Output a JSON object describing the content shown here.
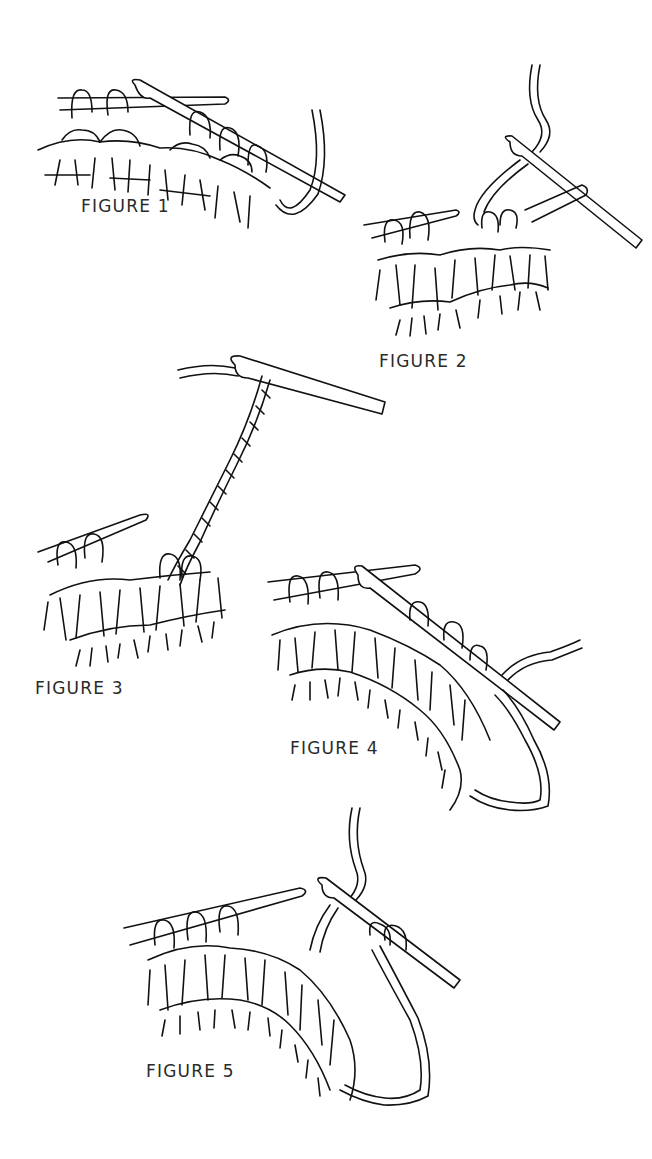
{
  "figures": [
    {
      "id": 1,
      "label": "FIGURE 1"
    },
    {
      "id": 2,
      "label": "FIGURE 2"
    },
    {
      "id": 3,
      "label": "FIGURE 3"
    },
    {
      "id": 4,
      "label": "FIGURE 4"
    },
    {
      "id": 5,
      "label": "FIGURE 5"
    }
  ],
  "colors": {
    "line": "#111111",
    "background": "#ffffff",
    "label": "#2a2a2a"
  }
}
